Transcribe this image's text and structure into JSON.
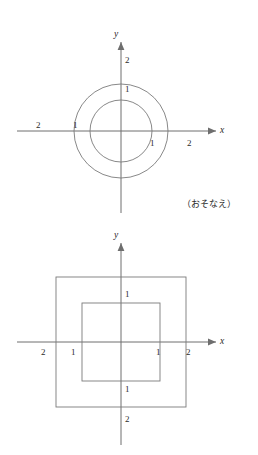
{
  "page": {
    "width": 258,
    "height": 455,
    "background": "#ffffff",
    "ink_color": "#2a2a2a",
    "line_color": "#7a7a7a",
    "axis_color": "#6e6e6e"
  },
  "caption": {
    "text": "（おそなえ）"
  },
  "figures": [
    {
      "id": "circles",
      "kind": "concentric-circles",
      "x_axis_label": "x",
      "y_axis_label": "y",
      "origin": {
        "x": 121,
        "y": 131
      },
      "radii": [
        31,
        47
      ],
      "ticks": {
        "x_left": [
          "1",
          "2"
        ],
        "x_right": [
          "1",
          "2"
        ],
        "y_up": [
          "1",
          "2"
        ]
      },
      "labels": [
        {
          "name": "y-tick-2",
          "text": "2",
          "x": 125,
          "y": 56
        },
        {
          "name": "y-tick-1",
          "text": "1",
          "x": 125,
          "y": 85
        },
        {
          "name": "x-tick-neg2",
          "text": "2",
          "x": 36,
          "y": 121
        },
        {
          "name": "x-tick-neg1",
          "text": "1",
          "x": 73,
          "y": 121
        },
        {
          "name": "x-tick-pos1",
          "text": "1",
          "x": 150,
          "y": 139
        },
        {
          "name": "x-tick-pos2",
          "text": "2",
          "x": 187,
          "y": 139
        }
      ]
    },
    {
      "id": "squares",
      "kind": "concentric-squares",
      "x_axis_label": "x",
      "y_axis_label": "y",
      "origin": {
        "x": 121,
        "y": 342
      },
      "half_widths": [
        39,
        65
      ],
      "ticks": {
        "x_left": [
          "1",
          "2"
        ],
        "x_right": [
          "1",
          "2"
        ],
        "y_up": [
          "1"
        ],
        "y_down": [
          "1",
          "2"
        ]
      },
      "labels": [
        {
          "name": "y-tick-1-up",
          "text": "1",
          "x": 125,
          "y": 290
        },
        {
          "name": "y-tick-1-down",
          "text": "1",
          "x": 125,
          "y": 385
        },
        {
          "name": "y-tick-2-down",
          "text": "2",
          "x": 125,
          "y": 415
        },
        {
          "name": "x-tick-neg2",
          "text": "2",
          "x": 41,
          "y": 348
        },
        {
          "name": "x-tick-neg1",
          "text": "1",
          "x": 71,
          "y": 348
        },
        {
          "name": "x-tick-pos1",
          "text": "1",
          "x": 156,
          "y": 348
        },
        {
          "name": "x-tick-pos2",
          "text": "2",
          "x": 186,
          "y": 348
        }
      ]
    }
  ]
}
